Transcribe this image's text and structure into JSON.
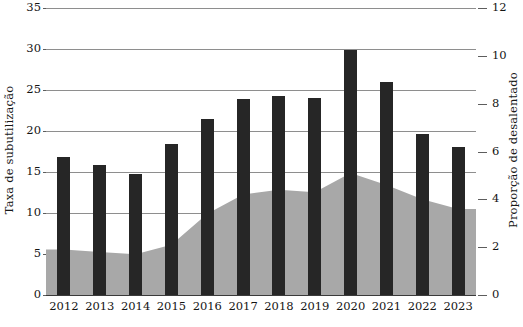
{
  "chart_data": {
    "type": "bar",
    "title": "",
    "xlabel": "",
    "categories": [
      "2012",
      "2013",
      "2014",
      "2015",
      "2016",
      "2017",
      "2018",
      "2019",
      "2020",
      "2021",
      "2022",
      "2023"
    ],
    "series": [
      {
        "name": "Taxa de subutilização",
        "type": "bar",
        "axis": "left",
        "color": "#262626",
        "values": [
          16.8,
          15.8,
          14.8,
          18.4,
          21.5,
          23.9,
          24.3,
          24.0,
          29.9,
          26.0,
          19.7,
          18.0
        ]
      },
      {
        "name": "Proporção de desalentado",
        "type": "area",
        "axis": "right",
        "color": "#a8a8a8",
        "values": [
          1.9,
          1.8,
          1.7,
          2.1,
          3.4,
          4.2,
          4.4,
          4.3,
          5.1,
          4.6,
          4.0,
          3.6
        ]
      }
    ],
    "left_axis": {
      "label": "Taxa de subutilização",
      "ticks": [
        0,
        5,
        10,
        15,
        20,
        25,
        30,
        35
      ],
      "ylim": [
        0,
        35
      ]
    },
    "right_axis": {
      "label": "Proporção de desalentado",
      "ticks": [
        0,
        2,
        4,
        6,
        8,
        10,
        12
      ],
      "ylim": [
        0,
        12
      ]
    },
    "grid": true,
    "legend": "none"
  },
  "axes": {
    "left_title": "Taxa de subutilização",
    "right_title": "Proporção de desalentado",
    "left_ticks": [
      "35",
      "30",
      "25",
      "20",
      "15",
      "10",
      "5",
      "0"
    ],
    "right_ticks": [
      "12",
      "10",
      "8",
      "6",
      "4",
      "2",
      "0"
    ]
  },
  "x_labels": [
    "2012",
    "2013",
    "2014",
    "2015",
    "2016",
    "2017",
    "2018",
    "2019",
    "2020",
    "2021",
    "2022",
    "2023"
  ]
}
